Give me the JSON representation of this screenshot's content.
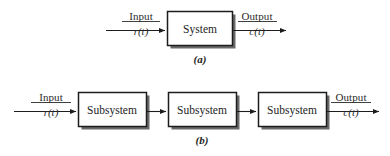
{
  "figure": {
    "title_a": "(a)",
    "title_b": "(b)",
    "block_system": "System",
    "block_subsystem_1": "Subsystem",
    "block_subsystem_2": "Subsystem",
    "block_subsystem_3": "Subsystem",
    "input_label_a": "Input",
    "input_signal_a": "r(t)",
    "output_label_a": "Output",
    "output_signal_a": "c(t)",
    "input_label_b": "Input",
    "input_signal_b": "r(t)",
    "output_label_b": "Output",
    "output_signal_b": "c(t)",
    "colors": {
      "stroke": "#1d1d1d",
      "shadow": "#5a5a5a",
      "text": "#2b2b2b",
      "background": "#ffffff"
    }
  }
}
